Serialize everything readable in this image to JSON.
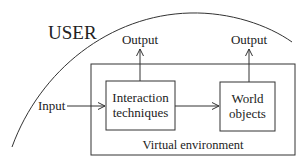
{
  "diagram": {
    "user_label": "USER",
    "input_label": "Input",
    "outputs": [
      "Output",
      "Output"
    ],
    "boxes": {
      "interaction": [
        "Interaction",
        "techniques"
      ],
      "world": [
        "World",
        "objects"
      ]
    },
    "container_label": "Virtual environment",
    "colors": {
      "stroke": "#333333",
      "text": "#222222",
      "background": "#ffffff"
    }
  }
}
